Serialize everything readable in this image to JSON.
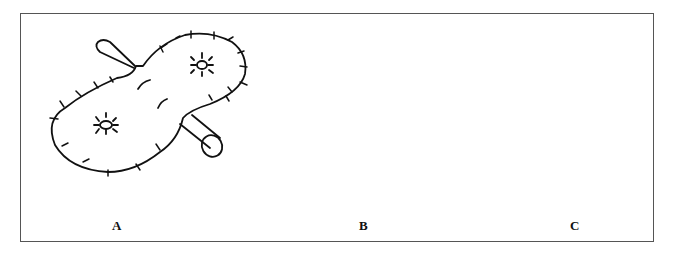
{
  "figure": {
    "panels": [
      {
        "id": "A",
        "label": "A",
        "description": "Peanut-shaped flap with sutures around margin, two stoma-like marks and two crossing tubes"
      },
      {
        "id": "B",
        "label": "B",
        "description": "Flap partially folded with dashed inner fold line and tubes"
      },
      {
        "id": "C",
        "label": "C",
        "description": "Circular double-walled ring with radial sutures and central stoma"
      }
    ],
    "colors": {
      "line": "#111111",
      "frame": "#555555",
      "background": "#ffffff"
    }
  }
}
